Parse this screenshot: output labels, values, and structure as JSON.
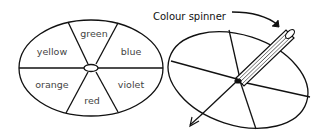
{
  "diagram": {
    "title": "Colour spinner",
    "colors": {
      "stroke": "#111111",
      "label": "#444444",
      "background": "#ffffff"
    },
    "left_disc": {
      "segments": [
        {
          "label": "green",
          "x": 94,
          "y": 36
        },
        {
          "label": "blue",
          "x": 129,
          "y": 53
        },
        {
          "label": "violet",
          "x": 131,
          "y": 84
        },
        {
          "label": "red",
          "x": 91,
          "y": 101
        },
        {
          "label": "orange",
          "x": 53,
          "y": 84
        },
        {
          "label": "yellow",
          "x": 52,
          "y": 53
        }
      ]
    },
    "right_disc": {
      "segments": 6,
      "pencil": "pencil through centre"
    },
    "arrow": "curved arrow pointing to spinner"
  }
}
